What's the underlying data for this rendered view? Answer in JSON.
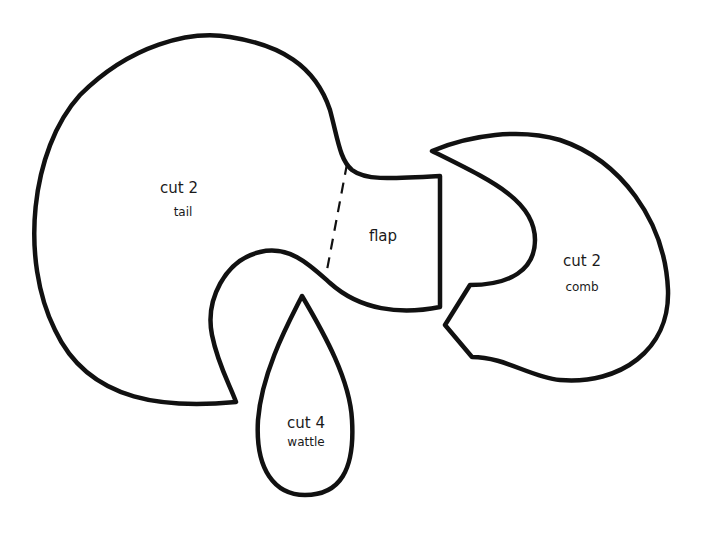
{
  "pattern": {
    "stroke_color": "#111111",
    "background": "#ffffff",
    "pieces": [
      {
        "id": "tail",
        "cut": "cut 2",
        "name": "tail"
      },
      {
        "id": "flap",
        "name": "flap",
        "fold_line": "dashed"
      },
      {
        "id": "comb",
        "cut": "cut 2",
        "name": "comb"
      },
      {
        "id": "wattle",
        "cut": "cut 4",
        "name": "wattle"
      }
    ]
  }
}
